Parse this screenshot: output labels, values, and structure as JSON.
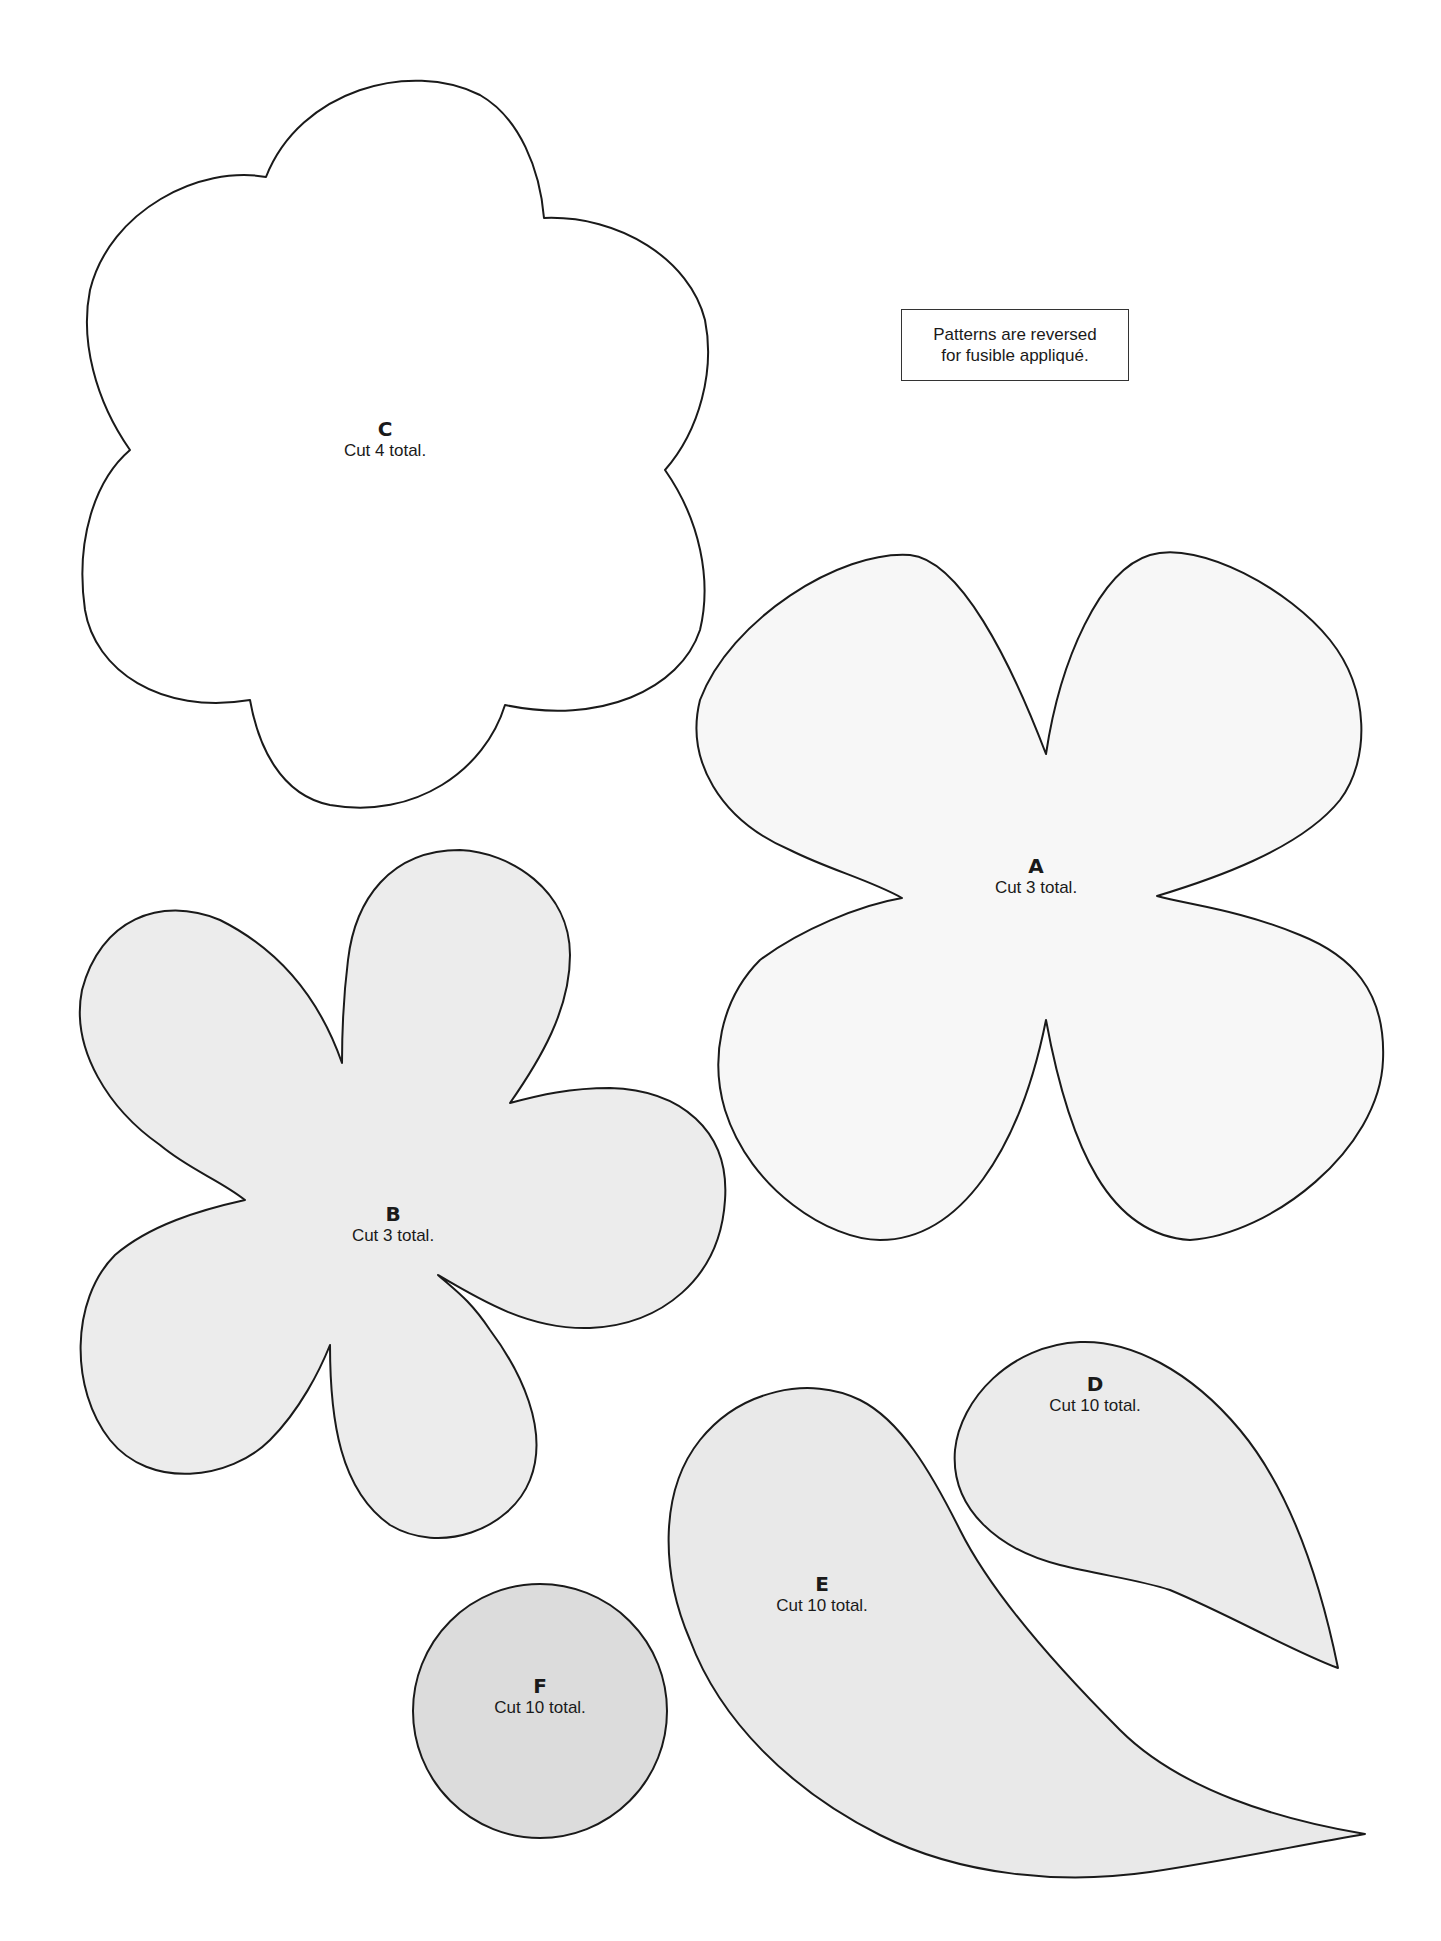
{
  "page": {
    "background": "#ffffff",
    "outline_color": "#1a1a1a"
  },
  "note": {
    "line1": "Patterns are reversed",
    "line2": "for fusible appliqué."
  },
  "patterns": {
    "A": {
      "letter": "A",
      "cut": "Cut 3 total.",
      "fill": "#f7f7f7",
      "shape": "four-petal-flower"
    },
    "B": {
      "letter": "B",
      "cut": "Cut 3 total.",
      "fill": "#ececec",
      "shape": "five-petal-flower"
    },
    "C": {
      "letter": "C",
      "cut": "Cut 4 total.",
      "fill": "#ffffff",
      "shape": "six-lobed-scalloped-flower"
    },
    "D": {
      "letter": "D",
      "cut": "Cut 10 total.",
      "fill": "#ebebeb",
      "shape": "small-leaf-teardrop"
    },
    "E": {
      "letter": "E",
      "cut": "Cut 10 total.",
      "fill": "#e9e9e9",
      "shape": "large-leaf-teardrop"
    },
    "F": {
      "letter": "F",
      "cut": "Cut 10 total.",
      "fill": "#dcdcdc",
      "shape": "circle"
    }
  }
}
